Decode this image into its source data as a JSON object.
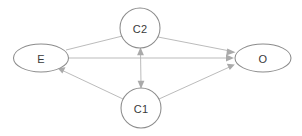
{
  "diagram": {
    "type": "causal-dag",
    "background_color": "#ffffff",
    "node_stroke_color": "#8c8c8c",
    "node_fill_color": "#ffffff",
    "edge_color": "#b3b3b3",
    "arrow_color": "#aaaaaa",
    "label_color": "#3a3a3a",
    "nodes": [
      {
        "id": "E",
        "label": "E",
        "shape": "ellipse",
        "cx": 41,
        "cy": 58,
        "rx": 27.5,
        "ry": 14
      },
      {
        "id": "C2",
        "label": "C2",
        "shape": "circle",
        "cx": 140,
        "cy": 28,
        "rx": 20,
        "ry": 20
      },
      {
        "id": "C1",
        "label": "C1",
        "shape": "circle",
        "cx": 141,
        "cy": 108,
        "rx": 20,
        "ry": 20
      },
      {
        "id": "O",
        "label": "O",
        "shape": "ellipse",
        "cx": 263,
        "cy": 58,
        "rx": 28,
        "ry": 14
      }
    ],
    "edges": [
      {
        "id": "e-to-o",
        "from": "E",
        "to": "O",
        "directed": true,
        "bidirectional": false
      },
      {
        "id": "e-to-c2",
        "from": "E",
        "to": "C2",
        "directed": false,
        "bidirectional": false
      },
      {
        "id": "c2-to-o",
        "from": "C2",
        "to": "O",
        "directed": true,
        "bidirectional": false
      },
      {
        "id": "c1-to-e",
        "from": "C1",
        "to": "E",
        "directed": true,
        "bidirectional": false
      },
      {
        "id": "c1-to-o",
        "from": "C1",
        "to": "O",
        "directed": true,
        "bidirectional": false
      },
      {
        "id": "c1-c2",
        "from": "C1",
        "to": "C2",
        "directed": true,
        "bidirectional": true
      }
    ]
  }
}
